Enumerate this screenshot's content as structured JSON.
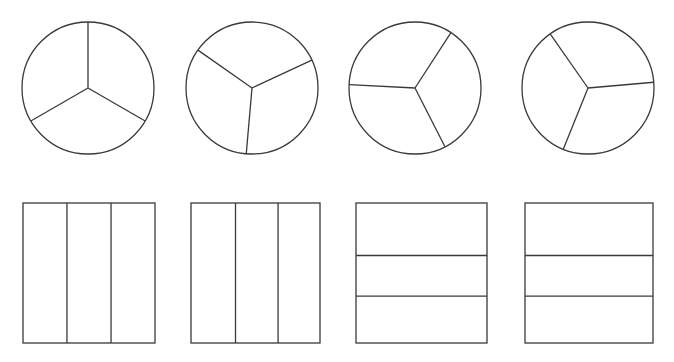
{
  "figure": {
    "canvas": {
      "width": 674,
      "height": 362
    },
    "background_color": "#ffffff",
    "stroke_color": "#3a3a3a",
    "stroke_width": 1.3,
    "row_labels": [
      "circle-row",
      "rectangle-row"
    ],
    "parts_per_shape": 3
  },
  "shapes": [
    {
      "id": "circle-1",
      "kind": "circle",
      "name": "circle-thirds-upright",
      "parts": 3,
      "equal_parts": true,
      "center": {
        "x": 88,
        "y": 88
      },
      "radius": 66,
      "radius_angles_deg": [
        90,
        210,
        330
      ],
      "description": "Circle divided into 3 equal sectors, one radius pointing straight up"
    },
    {
      "id": "circle-2",
      "kind": "circle",
      "name": "circle-thirds-rotated-a",
      "parts": 3,
      "equal_parts": true,
      "center": {
        "x": 252,
        "y": 88
      },
      "radius": 66,
      "radius_angles_deg": [
        145,
        25,
        265
      ],
      "description": "Circle divided into 3 equal sectors, rotated"
    },
    {
      "id": "circle-3",
      "kind": "circle",
      "name": "circle-thirds-rotated-b",
      "parts": 3,
      "equal_parts": true,
      "center": {
        "x": 415,
        "y": 88
      },
      "radius": 66,
      "radius_angles_deg": [
        177,
        57,
        297
      ],
      "description": "Circle divided into 3 equal sectors, one radius pointing left"
    },
    {
      "id": "circle-4",
      "kind": "circle",
      "name": "circle-thirds-rotated-c",
      "parts": 3,
      "equal_parts": true,
      "center": {
        "x": 588,
        "y": 88
      },
      "radius": 66,
      "radius_angles_deg": [
        125,
        5,
        248
      ],
      "description": "Circle divided into 3 equal sectors, rotated"
    },
    {
      "id": "rect-1",
      "kind": "rectangle",
      "name": "rectangle-vertical-thirds-equal",
      "parts": 3,
      "equal_parts": true,
      "orientation": "vertical",
      "bounds": {
        "x": 23,
        "y": 203,
        "width": 132,
        "height": 140
      },
      "divider_fractions": [
        0.333,
        0.667
      ],
      "description": "Rectangle divided into 3 equal vertical strips"
    },
    {
      "id": "rect-2",
      "kind": "rectangle",
      "name": "rectangle-vertical-thirds-uneven",
      "parts": 3,
      "equal_parts": false,
      "orientation": "vertical",
      "bounds": {
        "x": 191,
        "y": 203,
        "width": 129,
        "height": 140
      },
      "divider_fractions": [
        0.345,
        0.675
      ],
      "description": "Rectangle divided into 3 unequal vertical strips"
    },
    {
      "id": "rect-3",
      "kind": "rectangle",
      "name": "rectangle-horizontal-thirds-uneven-a",
      "parts": 3,
      "equal_parts": false,
      "orientation": "horizontal",
      "bounds": {
        "x": 356,
        "y": 203,
        "width": 131,
        "height": 140
      },
      "divider_fractions": [
        0.375,
        0.665
      ],
      "description": "Rectangle divided into 3 unequal horizontal bands"
    },
    {
      "id": "rect-4",
      "kind": "rectangle",
      "name": "rectangle-horizontal-thirds-uneven-b",
      "parts": 3,
      "equal_parts": false,
      "orientation": "horizontal",
      "bounds": {
        "x": 525,
        "y": 203,
        "width": 128,
        "height": 140
      },
      "divider_fractions": [
        0.375,
        0.665
      ],
      "description": "Rectangle divided into 3 unequal horizontal bands"
    }
  ]
}
